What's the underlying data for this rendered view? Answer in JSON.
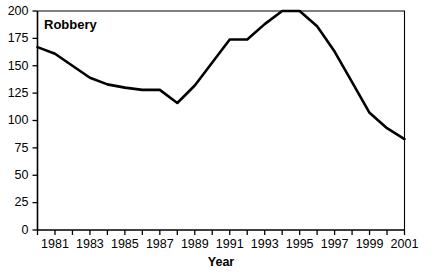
{
  "chart_data": {
    "type": "line",
    "title": "Robbery",
    "xlabel": "Year",
    "ylabel": "",
    "x": [
      1980,
      1981,
      1982,
      1983,
      1984,
      1985,
      1986,
      1987,
      1988,
      1989,
      1990,
      1991,
      1992,
      1993,
      1994,
      1995,
      1996,
      1997,
      1998,
      1999,
      2000,
      2001
    ],
    "values": [
      167,
      161,
      150,
      139,
      133,
      130,
      128,
      128,
      116,
      132,
      153,
      174,
      174,
      188,
      200,
      200,
      186,
      163,
      135,
      107,
      93,
      83
    ],
    "series": [
      {
        "name": "Robbery",
        "values": [
          167,
          161,
          150,
          139,
          133,
          130,
          128,
          128,
          116,
          132,
          153,
          174,
          174,
          188,
          200,
          200,
          186,
          163,
          135,
          107,
          93,
          83
        ]
      }
    ],
    "xlim": [
      1980,
      2001
    ],
    "ylim": [
      0,
      200
    ],
    "ytick_labels": [
      "0",
      "25",
      "50",
      "75",
      "100",
      "125",
      "150",
      "175",
      "200"
    ],
    "ytick_values": [
      0,
      25,
      50,
      75,
      100,
      125,
      150,
      175,
      200
    ],
    "xtick_values": [
      1980,
      1981,
      1982,
      1983,
      1984,
      1985,
      1986,
      1987,
      1988,
      1989,
      1990,
      1991,
      1992,
      1993,
      1994,
      1995,
      1996,
      1997,
      1998,
      1999,
      2000,
      2001
    ],
    "xtick_labels": [
      "",
      "1981",
      "",
      "1983",
      "",
      "1985",
      "",
      "1987",
      "",
      "1989",
      "",
      "1991",
      "",
      "1993",
      "",
      "1995",
      "",
      "1997",
      "",
      "1999",
      "",
      "2001"
    ],
    "grid": false,
    "legend": false,
    "line_color": "#000000",
    "background_color": "#ffffff"
  }
}
